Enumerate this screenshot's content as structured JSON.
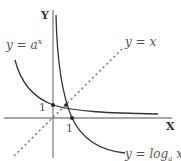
{
  "diagram": {
    "axes": {
      "x_label": "X",
      "y_label": "Y"
    },
    "curves": [
      {
        "id": "exponential",
        "label_prefix": "y = a",
        "label_sup": "x",
        "description": "decreasing exponential y = a^x (0 < a < 1)"
      },
      {
        "id": "logarithm",
        "label_prefix": "y = log",
        "label_sub": "a",
        "label_suffix": " x",
        "description": "decreasing logarithm y = log_a x (0 < a < 1)"
      },
      {
        "id": "identity",
        "label": "y = x",
        "style": "dashed",
        "description": "line of symmetry"
      }
    ],
    "ticks": {
      "y_one": "1",
      "x_one": "1"
    },
    "points": [
      {
        "name": "(0,1)",
        "on": "exponential"
      },
      {
        "name": "(1,0)",
        "on": "logarithm"
      },
      {
        "name": "intersection",
        "on": "y = x"
      }
    ],
    "colors": {
      "curve": "#333333",
      "axis": "#666666",
      "dashed": "#777777",
      "text": "#555555"
    }
  }
}
